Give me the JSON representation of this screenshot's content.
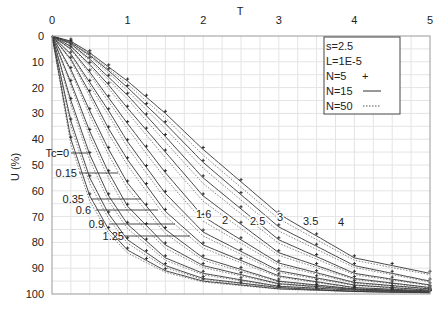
{
  "chart_data": {
    "type": "line",
    "title": "",
    "xlabel": "T",
    "ylabel": "U (%)",
    "xlim": [
      0,
      5
    ],
    "ylim": [
      100,
      0
    ],
    "x_axis_position": "top",
    "y_axis_inverted": true,
    "grid": true,
    "x_ticks": [
      "0",
      "1",
      "2",
      "3",
      "4",
      "5"
    ],
    "y_ticks": [
      "0",
      "10",
      "20",
      "30",
      "40",
      "50",
      "60",
      "70",
      "80",
      "90",
      "100"
    ],
    "legend": {
      "position": "upper-right",
      "params": [
        "s=2.5",
        "L=1E-5"
      ],
      "entries": [
        {
          "label": "N=5",
          "style": "markers-plus"
        },
        {
          "label": "N=15",
          "style": "solid"
        },
        {
          "label": "N=50",
          "style": "dotted"
        }
      ]
    },
    "curve_parameter": "Tc",
    "curve_labels": [
      "Tc=0",
      "0.15",
      "0.35",
      "0.6",
      "0.9",
      "1.25",
      "1.6",
      "2",
      "2.5",
      "3",
      "3.5",
      "4"
    ],
    "series": [
      {
        "name": "Tc=0",
        "tc": 0,
        "points": [
          [
            0,
            0
          ],
          [
            0.25,
            40
          ],
          [
            0.5,
            62
          ],
          [
            0.75,
            75
          ],
          [
            1,
            83
          ],
          [
            1.5,
            91
          ],
          [
            2,
            95
          ],
          [
            3,
            98
          ],
          [
            4,
            99
          ],
          [
            5,
            99.5
          ]
        ]
      },
      {
        "name": "Tc=0.15",
        "tc": 0.15,
        "points": [
          [
            0,
            0
          ],
          [
            0.25,
            33
          ],
          [
            0.5,
            55
          ],
          [
            0.75,
            69
          ],
          [
            1,
            79
          ],
          [
            1.5,
            89
          ],
          [
            2,
            94
          ],
          [
            3,
            97.5
          ],
          [
            4,
            99
          ],
          [
            5,
            99.5
          ]
        ]
      },
      {
        "name": "Tc=0.35",
        "tc": 0.35,
        "points": [
          [
            0,
            0
          ],
          [
            0.25,
            25
          ],
          [
            0.5,
            46
          ],
          [
            0.75,
            62
          ],
          [
            1,
            73
          ],
          [
            1.5,
            86
          ],
          [
            2,
            92
          ],
          [
            3,
            97
          ],
          [
            4,
            98.5
          ],
          [
            5,
            99.3
          ]
        ]
      },
      {
        "name": "Tc=0.6",
        "tc": 0.6,
        "points": [
          [
            0,
            0
          ],
          [
            0.25,
            18
          ],
          [
            0.5,
            37
          ],
          [
            0.75,
            53
          ],
          [
            1,
            66
          ],
          [
            1.5,
            81
          ],
          [
            2,
            89
          ],
          [
            3,
            96
          ],
          [
            4,
            98.2
          ],
          [
            5,
            99.2
          ]
        ]
      },
      {
        "name": "Tc=0.9",
        "tc": 0.9,
        "points": [
          [
            0,
            0
          ],
          [
            0.25,
            13
          ],
          [
            0.5,
            29
          ],
          [
            0.75,
            44
          ],
          [
            1,
            57
          ],
          [
            1.5,
            75
          ],
          [
            2,
            86
          ],
          [
            3,
            95
          ],
          [
            4,
            98
          ],
          [
            5,
            99
          ]
        ]
      },
      {
        "name": "Tc=1.25",
        "tc": 1.25,
        "points": [
          [
            0,
            0
          ],
          [
            0.25,
            9
          ],
          [
            0.5,
            22
          ],
          [
            0.75,
            36
          ],
          [
            1,
            48
          ],
          [
            1.5,
            68
          ],
          [
            2,
            81
          ],
          [
            3,
            93
          ],
          [
            4,
            97.5
          ],
          [
            5,
            98.8
          ]
        ]
      },
      {
        "name": "Tc=1.6",
        "tc": 1.6,
        "points": [
          [
            0,
            0
          ],
          [
            0.25,
            7
          ],
          [
            0.5,
            18
          ],
          [
            0.75,
            29
          ],
          [
            1,
            41
          ],
          [
            1.5,
            61
          ],
          [
            2,
            76
          ],
          [
            3,
            91
          ],
          [
            4,
            96.5
          ],
          [
            5,
            98.5
          ]
        ]
      },
      {
        "name": "Tc=2",
        "tc": 2,
        "points": [
          [
            0,
            0
          ],
          [
            0.25,
            5
          ],
          [
            0.5,
            14
          ],
          [
            0.75,
            24
          ],
          [
            1,
            34
          ],
          [
            1.5,
            53
          ],
          [
            2,
            70
          ],
          [
            3,
            88
          ],
          [
            4,
            95.5
          ],
          [
            5,
            98
          ]
        ]
      },
      {
        "name": "Tc=2.5",
        "tc": 2.5,
        "points": [
          [
            0,
            0
          ],
          [
            0.25,
            4
          ],
          [
            0.5,
            11
          ],
          [
            0.75,
            19
          ],
          [
            1,
            28
          ],
          [
            1.5,
            45
          ],
          [
            2,
            62
          ],
          [
            3,
            84
          ],
          [
            4,
            94
          ],
          [
            5,
            97.5
          ]
        ]
      },
      {
        "name": "Tc=3",
        "tc": 3,
        "points": [
          [
            0,
            0
          ],
          [
            0.25,
            3
          ],
          [
            0.5,
            9
          ],
          [
            0.75,
            16
          ],
          [
            1,
            23
          ],
          [
            1.5,
            39
          ],
          [
            2,
            55
          ],
          [
            3,
            79
          ],
          [
            4,
            92
          ],
          [
            5,
            96.5
          ]
        ]
      },
      {
        "name": "Tc=3.5",
        "tc": 3.5,
        "points": [
          [
            0,
            0
          ],
          [
            0.25,
            2.5
          ],
          [
            0.5,
            7.5
          ],
          [
            0.75,
            13.5
          ],
          [
            1,
            20
          ],
          [
            1.5,
            34
          ],
          [
            2,
            49
          ],
          [
            3,
            74
          ],
          [
            4,
            89
          ],
          [
            5,
            95
          ]
        ]
      },
      {
        "name": "Tc=4",
        "tc": 4,
        "points": [
          [
            0,
            0
          ],
          [
            0.25,
            2
          ],
          [
            0.5,
            6.5
          ],
          [
            0.75,
            12
          ],
          [
            1,
            17.5
          ],
          [
            1.5,
            30
          ],
          [
            2,
            44
          ],
          [
            3,
            69
          ],
          [
            4,
            86
          ],
          [
            5,
            92
          ]
        ]
      }
    ]
  }
}
